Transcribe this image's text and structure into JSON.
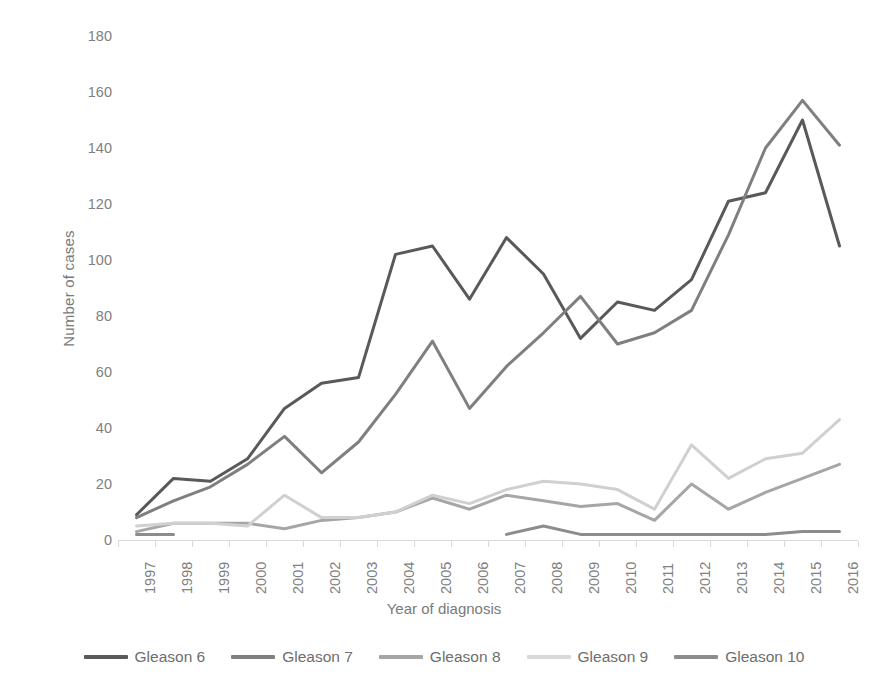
{
  "chart_data": {
    "type": "line",
    "title": "",
    "xlabel": "Year of diagnosis",
    "ylabel": "Number of cases",
    "categories": [
      "1997",
      "1998",
      "1999",
      "2000",
      "2001",
      "2002",
      "2003",
      "2004",
      "2005",
      "2006",
      "2007",
      "2008",
      "2009",
      "2010",
      "2011",
      "2012",
      "2013",
      "2014",
      "2015",
      "2016"
    ],
    "ylim": [
      0,
      180
    ],
    "yticks": [
      0,
      20,
      40,
      60,
      80,
      100,
      120,
      140,
      160,
      180
    ],
    "grid": false,
    "legend_position": "bottom",
    "series": [
      {
        "name": "Gleason 6",
        "color": "#595959",
        "values": [
          9,
          22,
          21,
          29,
          47,
          56,
          58,
          102,
          105,
          86,
          108,
          95,
          72,
          85,
          82,
          93,
          121,
          124,
          150,
          105
        ]
      },
      {
        "name": "Gleason 7",
        "color": "#7f7f7f",
        "values": [
          8,
          14,
          19,
          27,
          37,
          24,
          35,
          52,
          71,
          47,
          62,
          74,
          87,
          70,
          74,
          82,
          109,
          140,
          157,
          141
        ]
      },
      {
        "name": "Gleason 8",
        "color": "#a6a6a6",
        "values": [
          3,
          6,
          6,
          6,
          4,
          7,
          8,
          10,
          15,
          11,
          16,
          14,
          12,
          13,
          7,
          20,
          11,
          17,
          22,
          27
        ]
      },
      {
        "name": "Gleason 9",
        "color": "#d0d0d0",
        "values": [
          5,
          6,
          6,
          5,
          16,
          8,
          8,
          10,
          16,
          13,
          18,
          21,
          20,
          18,
          11,
          34,
          22,
          29,
          31,
          43
        ]
      },
      {
        "name": "Gleason 10",
        "color": "#8c8c8c",
        "segments": [
          {
            "start_index": 0,
            "values": [
              2,
              2
            ]
          },
          {
            "start_index": 10,
            "values": [
              2,
              5,
              2,
              2,
              2,
              2,
              2,
              2,
              3,
              3
            ]
          }
        ]
      }
    ]
  },
  "axes": {
    "y_title": "Number of cases",
    "x_title": "Year of diagnosis",
    "y_tick_labels": [
      "180",
      "160",
      "140",
      "120",
      "100",
      "80",
      "60",
      "40",
      "20",
      "0"
    ],
    "x_tick_labels": [
      "1997",
      "1998",
      "1999",
      "2000",
      "2001",
      "2002",
      "2003",
      "2004",
      "2005",
      "2006",
      "2007",
      "2008",
      "2009",
      "2010",
      "2011",
      "2012",
      "2013",
      "2014",
      "2015",
      "2016"
    ]
  },
  "legend": {
    "items": [
      {
        "label": "Gleason 6",
        "color": "#595959"
      },
      {
        "label": "Gleason 7",
        "color": "#7f7f7f"
      },
      {
        "label": "Gleason 8",
        "color": "#a6a6a6"
      },
      {
        "label": "Gleason 9",
        "color": "#d9d9d9"
      },
      {
        "label": "Gleason 10",
        "color": "#8c8c8c"
      }
    ]
  }
}
